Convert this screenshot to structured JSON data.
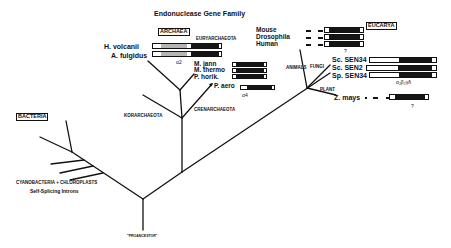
{
  "title": "Endonuclease Gene Family",
  "domains": {
    "archaea": "ARCHAEA",
    "eucarya": "EUCARYA",
    "bacteria": "BACTERIA"
  },
  "clades": {
    "euryarchaeota": "EURYARCHAEOTA",
    "crenarchaeota": "CRENARCHAEOTA",
    "korarchaeota": "KORARCHAEOTA",
    "animals": "ANIMALS",
    "fungi": "FUNGI",
    "plant": "PLANT"
  },
  "archaea_species": {
    "h_volcanii": "H. volcanii",
    "a_fulgidus": "A. fulgidus",
    "m_jann": "M. jann",
    "m_thermo": "M. thermo",
    "p_horik": "P. horik.",
    "p_aero": "P. aero"
  },
  "eucarya_species": {
    "mouse": "Mouse",
    "drosophila": "Drosophila",
    "human": "Human",
    "sc_sen34": "Sc. SEN34",
    "sc_sen2": "Sc. SEN2",
    "sp_sen34": "Sp. SEN34",
    "z_mays": "Z. mays"
  },
  "annotations": {
    "alpha2": "α2",
    "alpha4": "α4",
    "animals_q": "?",
    "fungi_subunits": "α₂β₂γδ",
    "zmays_q": "?"
  },
  "bacteria_notes": {
    "cyano": "CYANOBACTERIA + CHLOROPLASTS",
    "introns": "Self-Splicing Introns"
  },
  "root_label": "\"PROANCESTOR\"",
  "colors": {
    "ink": "#111111",
    "gray_segment": "#b5b5b5",
    "dark_segment": "#151515"
  }
}
